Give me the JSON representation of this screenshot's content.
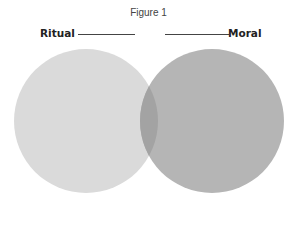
{
  "figure": {
    "title": "Figure 1",
    "sets": [
      {
        "label": "Ritual",
        "color": "#dadada",
        "cx": 86,
        "cy": 121,
        "r": 72
      },
      {
        "label": "Moral",
        "color": "#b5b5b5",
        "cx": 212,
        "cy": 121,
        "r": 72
      }
    ],
    "overlap_color": "#a3a3a3",
    "background": "#ffffff"
  }
}
